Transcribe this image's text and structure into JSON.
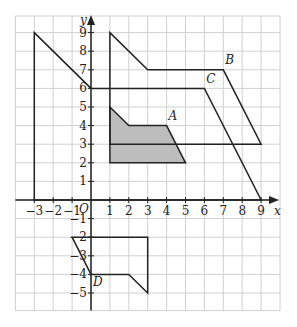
{
  "axes": {
    "x_label": "x",
    "y_label": "y",
    "origin_label": "O",
    "x_ticks": [
      "−3",
      "−2",
      "−1",
      "1",
      "2",
      "3",
      "4",
      "5",
      "6",
      "7",
      "8",
      "9"
    ],
    "x_tick_values": [
      -3,
      -2,
      -1,
      1,
      2,
      3,
      4,
      5,
      6,
      7,
      8,
      9
    ],
    "y_ticks": [
      "9",
      "8",
      "7",
      "6",
      "5",
      "4",
      "3",
      "2",
      "1",
      "−1",
      "−2",
      "−3",
      "−4",
      "−5"
    ],
    "y_tick_values": [
      9,
      8,
      7,
      6,
      5,
      4,
      3,
      2,
      1,
      -1,
      -2,
      -3,
      -4,
      -5
    ],
    "grid": {
      "x_min": -4,
      "x_max": 10,
      "y_min": -6,
      "y_max": 10
    }
  },
  "shapes": {
    "A": {
      "label": "A",
      "shaded": true,
      "vertices": [
        [
          1,
          5
        ],
        [
          2,
          4
        ],
        [
          4,
          4
        ],
        [
          5,
          2
        ],
        [
          1,
          2
        ]
      ],
      "label_pos": [
        4.1,
        4.3
      ]
    },
    "B": {
      "label": "B",
      "vertices": [
        [
          1,
          9
        ],
        [
          3,
          7
        ],
        [
          7,
          7
        ],
        [
          9,
          3
        ],
        [
          1,
          3
        ]
      ],
      "label_pos": [
        7.1,
        7.3
      ]
    },
    "C": {
      "label": "C",
      "vertices": [
        [
          -3,
          9
        ],
        [
          0,
          6
        ],
        [
          6,
          6
        ],
        [
          9,
          0
        ],
        [
          -3,
          0
        ]
      ],
      "label_pos": [
        6.1,
        6.3
      ]
    },
    "D": {
      "label": "D",
      "vertices": [
        [
          0,
          -4
        ],
        [
          -1,
          -2
        ],
        [
          3,
          -2
        ],
        [
          3,
          -5
        ],
        [
          2,
          -4
        ]
      ],
      "label_pos": [
        0.1,
        -4.6
      ]
    }
  },
  "colors": {
    "grid": "#d0d0d0",
    "lines": "#222222",
    "shade": "#bdbdbd"
  }
}
